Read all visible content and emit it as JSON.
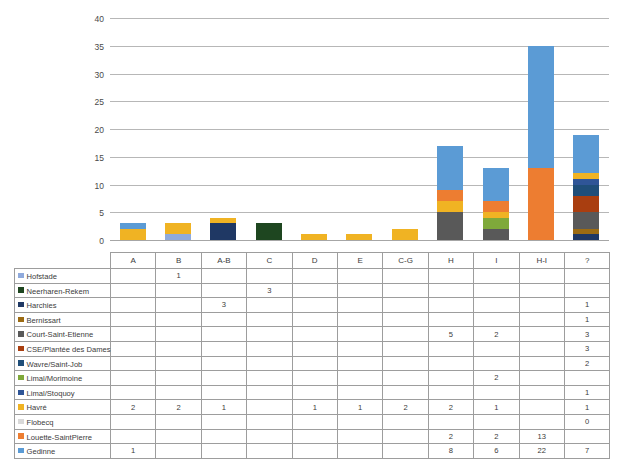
{
  "chart_data": {
    "type": "bar",
    "stacked": true,
    "title": "",
    "xlabel": "",
    "ylabel": "",
    "ylim": [
      0,
      40
    ],
    "ytick_step": 5,
    "yticks": [
      0,
      5,
      10,
      15,
      20,
      25,
      30,
      35,
      40
    ],
    "grid": true,
    "legend_position": "table-left",
    "categories": [
      "A",
      "B",
      "A-B",
      "C",
      "D",
      "E",
      "C-G",
      "H",
      "I",
      "H-I",
      "?"
    ],
    "series": [
      {
        "name": "Hofstade",
        "color": "#8faadc",
        "values": [
          null,
          1,
          null,
          null,
          null,
          null,
          null,
          null,
          null,
          null,
          null
        ]
      },
      {
        "name": "Neerharen-Rekem",
        "color": "#1e4620",
        "values": [
          null,
          null,
          null,
          3,
          null,
          null,
          null,
          null,
          null,
          null,
          null
        ]
      },
      {
        "name": "Harchies",
        "color": "#1f3864",
        "values": [
          null,
          null,
          3,
          null,
          null,
          null,
          null,
          null,
          null,
          null,
          1
        ]
      },
      {
        "name": "Bernissart",
        "color": "#9c6b12",
        "values": [
          null,
          null,
          null,
          null,
          null,
          null,
          null,
          null,
          null,
          null,
          1
        ]
      },
      {
        "name": "Court-Saint-Etienne",
        "color": "#595959",
        "values": [
          null,
          null,
          null,
          null,
          null,
          null,
          null,
          5,
          2,
          null,
          3
        ]
      },
      {
        "name": "CSE/Plantée des Dames",
        "color": "#a93e10",
        "values": [
          null,
          null,
          null,
          null,
          null,
          null,
          null,
          null,
          null,
          null,
          3
        ]
      },
      {
        "name": "Wavre/Saint-Job",
        "color": "#1f4e79",
        "values": [
          null,
          null,
          null,
          null,
          null,
          null,
          null,
          null,
          null,
          null,
          2
        ]
      },
      {
        "name": "Limal/Morimoine",
        "color": "#7fa93b",
        "values": [
          null,
          null,
          null,
          null,
          null,
          null,
          null,
          null,
          2,
          null,
          null
        ]
      },
      {
        "name": "Limal/Stoquoy",
        "color": "#2f5597",
        "values": [
          null,
          null,
          null,
          null,
          null,
          null,
          null,
          null,
          null,
          null,
          1
        ]
      },
      {
        "name": "Havré",
        "color": "#f0b323",
        "values": [
          2,
          2,
          1,
          null,
          1,
          1,
          2,
          2,
          1,
          null,
          1
        ]
      },
      {
        "name": "Flobecq",
        "color": "#d9d9d9",
        "values": [
          null,
          null,
          null,
          null,
          null,
          null,
          null,
          null,
          null,
          null,
          0
        ]
      },
      {
        "name": "Louette-SaintPierre",
        "color": "#ed7d31",
        "values": [
          null,
          null,
          null,
          null,
          null,
          null,
          null,
          2,
          2,
          13,
          null
        ]
      },
      {
        "name": "Gedinne",
        "color": "#5b9bd5",
        "values": [
          1,
          null,
          null,
          null,
          null,
          null,
          null,
          8,
          6,
          22,
          7
        ]
      }
    ],
    "column_totals": [
      3,
      3,
      4,
      3,
      1,
      1,
      2,
      17,
      13,
      35,
      19
    ]
  },
  "table": {
    "header_blank": "",
    "columns": [
      "A",
      "B",
      "A-B",
      "C",
      "D",
      "E",
      "C-G",
      "H",
      "I",
      "H-I",
      "?"
    ],
    "rows": [
      {
        "label": "Hofstade",
        "swatch": "#8faadc",
        "cells": [
          "",
          "1",
          "",
          "",
          "",
          "",
          "",
          "",
          "",
          "",
          ""
        ]
      },
      {
        "label": "Neerharen-Rekem",
        "swatch": "#1e4620",
        "cells": [
          "",
          "",
          "",
          "3",
          "",
          "",
          "",
          "",
          "",
          "",
          ""
        ]
      },
      {
        "label": "Harchies",
        "swatch": "#1f3864",
        "cells": [
          "",
          "",
          "3",
          "",
          "",
          "",
          "",
          "",
          "",
          "",
          "1"
        ]
      },
      {
        "label": "Bernissart",
        "swatch": "#9c6b12",
        "cells": [
          "",
          "",
          "",
          "",
          "",
          "",
          "",
          "",
          "",
          "",
          "1"
        ]
      },
      {
        "label": "Court-Saint-Etienne",
        "swatch": "#595959",
        "cells": [
          "",
          "",
          "",
          "",
          "",
          "",
          "",
          "5",
          "2",
          "",
          "3"
        ]
      },
      {
        "label": "CSE/Plantée des Dames",
        "swatch": "#a93e10",
        "cells": [
          "",
          "",
          "",
          "",
          "",
          "",
          "",
          "",
          "",
          "",
          "3"
        ]
      },
      {
        "label": "Wavre/Saint-Job",
        "swatch": "#1f4e79",
        "cells": [
          "",
          "",
          "",
          "",
          "",
          "",
          "",
          "",
          "",
          "",
          "2"
        ]
      },
      {
        "label": "Limal/Morimoine",
        "swatch": "#7fa93b",
        "cells": [
          "",
          "",
          "",
          "",
          "",
          "",
          "",
          "",
          "2",
          "",
          ""
        ]
      },
      {
        "label": "Limal/Stoquoy",
        "swatch": "#2f5597",
        "cells": [
          "",
          "",
          "",
          "",
          "",
          "",
          "",
          "",
          "",
          "",
          "1"
        ]
      },
      {
        "label": "Havré",
        "swatch": "#f0b323",
        "cells": [
          "2",
          "2",
          "1",
          "",
          "1",
          "1",
          "2",
          "2",
          "1",
          "",
          "1"
        ]
      },
      {
        "label": "Flobecq",
        "swatch": "#d9d9d9",
        "cells": [
          "",
          "",
          "",
          "",
          "",
          "",
          "",
          "",
          "",
          "",
          "0"
        ]
      },
      {
        "label": "Louette-SaintPierre",
        "swatch": "#ed7d31",
        "cells": [
          "",
          "",
          "",
          "",
          "",
          "",
          "",
          "2",
          "2",
          "13",
          ""
        ]
      },
      {
        "label": "Gedinne",
        "swatch": "#5b9bd5",
        "cells": [
          "1",
          "",
          "",
          "",
          "",
          "",
          "",
          "8",
          "6",
          "22",
          "7"
        ]
      }
    ]
  }
}
